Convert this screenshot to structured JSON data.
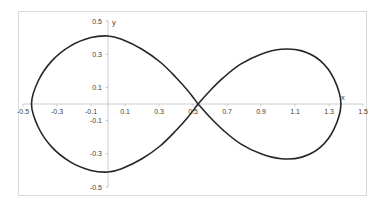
{
  "chart_data": {
    "type": "scatter",
    "title": "",
    "xlabel": "x",
    "ylabel": "y",
    "xlim": [
      -0.5,
      1.5
    ],
    "ylim": [
      -0.5,
      0.5
    ],
    "x_ticks": [
      "-0.5",
      "-0.3",
      "-0.1",
      "0.1",
      "0.3",
      "0.5",
      "0.7",
      "0.9",
      "1.1",
      "1.3",
      "1.5"
    ],
    "y_ticks": [
      "0.5",
      "0.3",
      "0.1",
      "-0.1",
      "-0.3",
      "-0.5"
    ],
    "grid": false,
    "legend": "none",
    "series": [
      {
        "name": "curve",
        "style": "smooth-line",
        "color": "#262626",
        "points": [
          [
            0.53,
            0.0
          ],
          [
            0.47,
            0.08
          ],
          [
            0.4,
            0.16
          ],
          [
            0.31,
            0.25
          ],
          [
            0.2,
            0.33
          ],
          [
            0.08,
            0.39
          ],
          [
            0.0,
            0.41
          ],
          [
            -0.1,
            0.4
          ],
          [
            -0.22,
            0.35
          ],
          [
            -0.33,
            0.26
          ],
          [
            -0.41,
            0.14
          ],
          [
            -0.45,
            0.0
          ],
          [
            -0.41,
            -0.14
          ],
          [
            -0.33,
            -0.26
          ],
          [
            -0.22,
            -0.35
          ],
          [
            -0.1,
            -0.4
          ],
          [
            0.0,
            -0.41
          ],
          [
            0.08,
            -0.39
          ],
          [
            0.2,
            -0.33
          ],
          [
            0.31,
            -0.25
          ],
          [
            0.4,
            -0.16
          ],
          [
            0.47,
            -0.08
          ],
          [
            0.53,
            0.0
          ],
          [
            0.6,
            0.08
          ],
          [
            0.68,
            0.16
          ],
          [
            0.78,
            0.24
          ],
          [
            0.9,
            0.3
          ],
          [
            1.02,
            0.33
          ],
          [
            1.14,
            0.32
          ],
          [
            1.25,
            0.26
          ],
          [
            1.33,
            0.15
          ],
          [
            1.37,
            0.0
          ],
          [
            1.33,
            -0.15
          ],
          [
            1.25,
            -0.26
          ],
          [
            1.14,
            -0.32
          ],
          [
            1.02,
            -0.33
          ],
          [
            0.9,
            -0.3
          ],
          [
            0.78,
            -0.24
          ],
          [
            0.68,
            -0.16
          ],
          [
            0.6,
            -0.08
          ],
          [
            0.53,
            0.0
          ]
        ]
      }
    ],
    "colors": {
      "frame": "#d9d9d9",
      "axis": "#bfbfbf",
      "curve": "#262626",
      "text": "#404040"
    }
  }
}
